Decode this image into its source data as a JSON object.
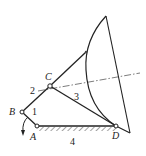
{
  "diagram": {
    "type": "four-bar linkage mechanism (antenna drive)",
    "points": {
      "A": {
        "label": "A",
        "x": 37,
        "y": 126
      },
      "B": {
        "label": "B",
        "x": 22,
        "y": 112
      },
      "C": {
        "label": "C",
        "x": 50,
        "y": 86
      },
      "D": {
        "label": "D",
        "x": 116,
        "y": 126
      }
    },
    "links": [
      {
        "id": "1",
        "label": "1",
        "from": "A",
        "to": "B"
      },
      {
        "id": "2",
        "label": "2",
        "from": "B",
        "to": "C"
      },
      {
        "id": "3",
        "label": "3",
        "from": "C",
        "to": "D"
      },
      {
        "id": "4",
        "label": "4",
        "from": "A",
        "to": "D",
        "ground": true
      }
    ],
    "labels": {
      "A": "A",
      "B": "B",
      "C": "C",
      "D": "D",
      "link1": "1",
      "link2": "2",
      "link3": "3",
      "link4": "4"
    },
    "colors": {
      "stroke": "#222222",
      "background": "#ffffff"
    }
  }
}
